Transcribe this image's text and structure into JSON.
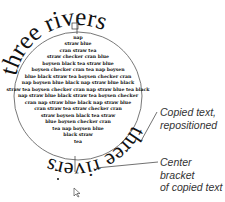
{
  "diagram": {
    "path_text": {
      "original": "three rivers",
      "copied": "three rivers"
    },
    "body_lines": [
      "nap",
      "straw blue",
      "cran straw tea",
      "straw checker cran  blue",
      "boysen black tea  straw blue",
      "boysen checker cran tea nap boysen",
      "blue black straw tea boysen checker cran",
      "nap boysen blue black nap straw blue black",
      "straw tea boysen checker cran nap straw blue tea black",
      "nap straw blue black straw tea boysen checker",
      "cran nap straw blue black nap straw blue",
      "cran straw tea straw checker cran",
      "straw boysen black tea  straw",
      "blue boysen checker cran",
      "tea nap boysen blue",
      "black straw",
      "tea"
    ],
    "callouts": [
      {
        "id": "copied",
        "lines": [
          "Copied text,",
          "repositioned"
        ]
      },
      {
        "id": "bracket",
        "lines": [
          "Center bracket",
          "of copied text"
        ]
      }
    ],
    "colors": {
      "ink": "#111111",
      "callout": "#333333",
      "circle": "#555555"
    }
  }
}
